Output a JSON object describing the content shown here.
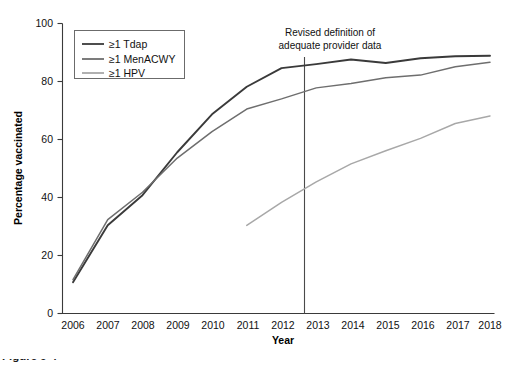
{
  "figure": {
    "caption": "Figure 9-4",
    "background_color": "#ffffff"
  },
  "chart_data": {
    "type": "line",
    "title": "",
    "xlabel": "Year",
    "ylabel": "Percentage vaccinated",
    "x": [
      2006,
      2007,
      2008,
      2009,
      2010,
      2011,
      2012,
      2013,
      2014,
      2015,
      2016,
      2017,
      2018
    ],
    "categories": [
      "2006",
      "2007",
      "2008",
      "2009",
      "2010",
      "2011",
      "2012",
      "2013",
      "2014",
      "2015",
      "2016",
      "2017",
      "2018"
    ],
    "xlim": [
      2006,
      2018
    ],
    "ylim": [
      0,
      100
    ],
    "yticks": [
      0,
      20,
      40,
      60,
      80,
      100
    ],
    "ytick_labels": [
      "0",
      "20",
      "40",
      "60",
      "80",
      "100"
    ],
    "grid": false,
    "legend_position": "top-left",
    "series": [
      {
        "name": "≥1 Tdap",
        "color": "#3a3a3a",
        "line_width": 1.9,
        "values": [
          10.8,
          30.4,
          40.8,
          55.6,
          68.7,
          78.2,
          84.6,
          86.0,
          87.6,
          86.4,
          88.0,
          88.7,
          88.9
        ]
      },
      {
        "name": "≥1 MenACWY",
        "color": "#6e6e6e",
        "line_width": 1.5,
        "values": [
          11.7,
          32.4,
          41.8,
          53.6,
          62.7,
          70.5,
          74.0,
          77.8,
          79.3,
          81.3,
          82.2,
          85.1,
          86.6
        ]
      },
      {
        "name": "≥1 HPV",
        "color": "#a8a8a8",
        "line_width": 1.5,
        "values": [
          null,
          null,
          null,
          null,
          null,
          30.4,
          38.3,
          45.4,
          51.6,
          56.1,
          60.4,
          65.5,
          68.1
        ]
      }
    ],
    "annotations": [
      {
        "name": "revised-definition-note",
        "line1": "Revised definition of",
        "line2": "adequate provider data",
        "marker_x": 2013,
        "marker_type": "vertical-reference-line"
      }
    ]
  }
}
